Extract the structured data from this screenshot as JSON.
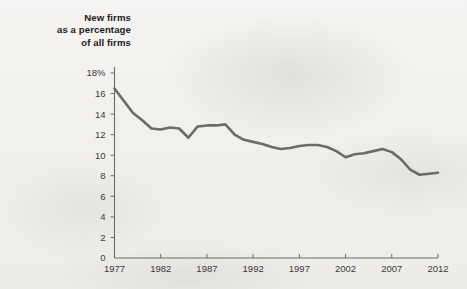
{
  "chart_data": {
    "type": "line",
    "title": "New firms as a percentage of all firms",
    "title_lines": [
      "New firms",
      "as a percentage",
      "of all firms"
    ],
    "xlabel": "",
    "ylabel": "",
    "xlim": [
      1977,
      2012
    ],
    "ylim": [
      0,
      18
    ],
    "grid": false,
    "legend": null,
    "y_ticks": [
      0,
      2,
      4,
      6,
      8,
      10,
      12,
      14,
      16,
      18
    ],
    "y_tick_labels": [
      "0",
      "2",
      "4",
      "6",
      "8",
      "10",
      "12",
      "14",
      "16",
      "18%"
    ],
    "x_ticks": [
      1977,
      1982,
      1987,
      1992,
      1997,
      2002,
      2007,
      2012
    ],
    "x_tick_labels": [
      "1977",
      "1982",
      "1987",
      "1992",
      "1997",
      "2002",
      "2007",
      "2012"
    ],
    "series": [
      {
        "name": "New firms as a percentage of all firms",
        "color": "#6b6b6b",
        "x": [
          1977,
          1978,
          1979,
          1980,
          1981,
          1982,
          1983,
          1984,
          1985,
          1986,
          1987,
          1988,
          1989,
          1990,
          1991,
          1992,
          1993,
          1994,
          1995,
          1996,
          1997,
          1998,
          1999,
          2000,
          2001,
          2002,
          2003,
          2004,
          2005,
          2006,
          2007,
          2008,
          2009,
          2010,
          2011,
          2012
        ],
        "values": [
          16.5,
          15.3,
          14.1,
          13.4,
          12.6,
          12.5,
          12.7,
          12.6,
          11.7,
          12.8,
          12.9,
          12.9,
          13.0,
          12.0,
          11.5,
          11.3,
          11.1,
          10.8,
          10.6,
          10.7,
          10.9,
          11.0,
          11.0,
          10.8,
          10.4,
          9.8,
          10.1,
          10.2,
          10.4,
          10.6,
          10.3,
          9.6,
          8.6,
          8.1,
          8.2,
          8.3
        ]
      }
    ]
  },
  "axis": {
    "y_axis_name": "percentage-axis",
    "x_axis_name": "year-axis"
  }
}
